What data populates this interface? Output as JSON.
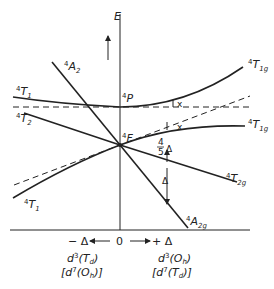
{
  "diagram": {
    "axis_y_label": "E",
    "free_ion_terms": {
      "upper": "P",
      "lower": "F",
      "multiplicity": "4"
    },
    "left_states": {
      "A2": {
        "mult": "4",
        "sym": "A",
        "sub": "2"
      },
      "T1_upper": {
        "mult": "4",
        "sym": "T",
        "sub": "1"
      },
      "T2": {
        "mult": "4",
        "sym": "T",
        "sub": "2"
      },
      "T1_lower": {
        "mult": "4",
        "sym": "T",
        "sub": "1"
      }
    },
    "right_states": {
      "T1g_upper": {
        "mult": "4",
        "sym": "T",
        "sub": "1g"
      },
      "T1g_lower": {
        "mult": "4",
        "sym": "T",
        "sub": "1g"
      },
      "T2g": {
        "mult": "4",
        "sym": "T",
        "sub": "2g"
      },
      "A2g": {
        "mult": "4",
        "sym": "A",
        "sub": "2g"
      }
    },
    "annotations": {
      "x_mark": "x",
      "four_fifths": {
        "num": "4",
        "den": "5",
        "sym": "Δ"
      },
      "delta": "Δ"
    },
    "x_axis": {
      "left": "− Δ",
      "zero": "0",
      "right": "+ Δ"
    },
    "left_caption": {
      "line1": "d³(T_d)",
      "line2": "[d⁷(O_h)]"
    },
    "right_caption": {
      "line1": "d³(O_h)",
      "line2": "[d⁷(T_d)]"
    },
    "left_caption_parts": {
      "l1a": "d",
      "l1sup": "3",
      "l1b": "(T",
      "l1sub": "d",
      "l1c": ")",
      "l2a": "[d",
      "l2sup": "7",
      "l2b": "(O",
      "l2sub": "h",
      "l2c": ")]"
    },
    "right_caption_parts": {
      "l1a": "d",
      "l1sup": "3",
      "l1b": "(O",
      "l1sub": "h",
      "l1c": ")",
      "l2a": "[d",
      "l2sup": "7",
      "l2b": "(T",
      "l2sub": "d",
      "l2c": ")]"
    }
  }
}
